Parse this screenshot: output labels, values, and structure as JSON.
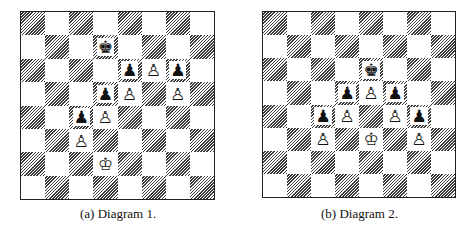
{
  "figures": [
    {
      "id": "a",
      "caption": "(a) Diagram 1.",
      "pieces": [
        {
          "square": "d7",
          "color": "black",
          "type": "king",
          "glyph": "♚"
        },
        {
          "square": "e6",
          "color": "black",
          "type": "pawn",
          "glyph": "♟"
        },
        {
          "square": "f6",
          "color": "white",
          "type": "pawn",
          "glyph": "♙"
        },
        {
          "square": "g6",
          "color": "black",
          "type": "pawn",
          "glyph": "♟"
        },
        {
          "square": "d5",
          "color": "black",
          "type": "pawn",
          "glyph": "♟"
        },
        {
          "square": "e5",
          "color": "white",
          "type": "pawn",
          "glyph": "♙"
        },
        {
          "square": "g5",
          "color": "white",
          "type": "pawn",
          "glyph": "♙"
        },
        {
          "square": "c4",
          "color": "black",
          "type": "pawn",
          "glyph": "♟"
        },
        {
          "square": "d4",
          "color": "white",
          "type": "pawn",
          "glyph": "♙"
        },
        {
          "square": "c3",
          "color": "white",
          "type": "pawn",
          "glyph": "♙"
        },
        {
          "square": "d2",
          "color": "white",
          "type": "king",
          "glyph": "♔"
        }
      ]
    },
    {
      "id": "b",
      "caption": "(b) Diagram 2.",
      "pieces": [
        {
          "square": "e6",
          "color": "black",
          "type": "king",
          "glyph": "♚"
        },
        {
          "square": "d5",
          "color": "black",
          "type": "pawn",
          "glyph": "♟"
        },
        {
          "square": "e5",
          "color": "white",
          "type": "pawn",
          "glyph": "♙"
        },
        {
          "square": "f5",
          "color": "black",
          "type": "pawn",
          "glyph": "♟"
        },
        {
          "square": "c4",
          "color": "black",
          "type": "pawn",
          "glyph": "♟"
        },
        {
          "square": "d4",
          "color": "white",
          "type": "pawn",
          "glyph": "♙"
        },
        {
          "square": "f4",
          "color": "white",
          "type": "pawn",
          "glyph": "♙"
        },
        {
          "square": "g4",
          "color": "black",
          "type": "pawn",
          "glyph": "♟"
        },
        {
          "square": "c3",
          "color": "white",
          "type": "pawn",
          "glyph": "♙"
        },
        {
          "square": "e3",
          "color": "white",
          "type": "king",
          "glyph": "♔"
        },
        {
          "square": "g3",
          "color": "white",
          "type": "pawn",
          "glyph": "♙"
        }
      ]
    }
  ]
}
